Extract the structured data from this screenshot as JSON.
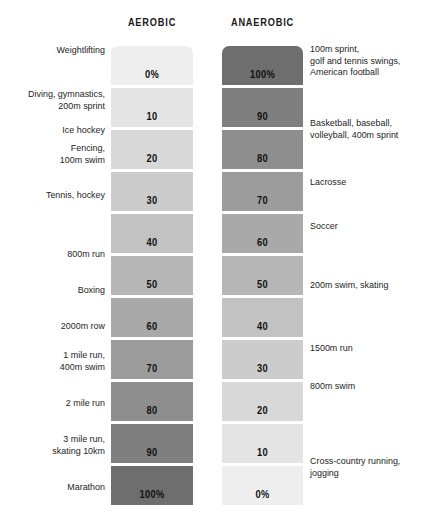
{
  "headers": {
    "left": "AEROBIC",
    "right": "ANAEROBIC"
  },
  "chart_data": {
    "type": "bar",
    "title": "",
    "subtitle": "",
    "xlabel": "",
    "ylabel": "",
    "grid": false,
    "legend_position": "top",
    "orientation": "horizontal-paired-columns",
    "categories": [
      "row-1",
      "row-2",
      "row-3",
      "row-4",
      "row-5",
      "row-6",
      "row-7",
      "row-8",
      "row-9",
      "row-10",
      "row-11"
    ],
    "series": [
      {
        "name": "AEROBIC",
        "values": [
          0,
          10,
          20,
          30,
          40,
          50,
          60,
          70,
          80,
          90,
          100
        ],
        "value_labels": [
          "0%",
          "10",
          "20",
          "30",
          "40",
          "50",
          "60",
          "70",
          "80",
          "90",
          "100%"
        ],
        "colors": [
          "#eeeeee",
          "#e4e4e4",
          "#d8d8d8",
          "#cccccc",
          "#c2c2c2",
          "#b6b6b6",
          "#a9a9a9",
          "#9c9c9c",
          "#8e8e8e",
          "#7f7f7f",
          "#6e6e6e"
        ]
      },
      {
        "name": "ANAEROBIC",
        "values": [
          100,
          90,
          80,
          70,
          60,
          50,
          40,
          30,
          20,
          10,
          0
        ],
        "value_labels": [
          "100%",
          "90",
          "80",
          "70",
          "60",
          "50",
          "40",
          "30",
          "20",
          "10",
          "0%"
        ],
        "colors": [
          "#6e6e6e",
          "#7f7f7f",
          "#8e8e8e",
          "#9c9c9c",
          "#a9a9a9",
          "#b6b6b6",
          "#c2c2c2",
          "#cccccc",
          "#d8d8d8",
          "#e4e4e4",
          "#eeeeee"
        ]
      }
    ],
    "annotations_left": [
      "Weightlifting",
      "Diving, gymnastics,\n200m sprint",
      "Ice hockey",
      "Fencing,\n100m swim",
      "Tennis, hockey",
      "800m run",
      "Boxing",
      "2000m row",
      "1 mile run,\n400m swim",
      "2 mile run",
      "3 mile run,\nskating 10km",
      "Marathon"
    ],
    "annotations_right": [
      "100m sprint,\ngolf and tennis swings,\nAmerican football",
      "Basketball, baseball,\nvolleyball, 400m sprint",
      "Lacrosse",
      "Soccer",
      "200m swim, skating",
      "1500m run",
      "800m swim",
      "Cross-country running,\njogging"
    ]
  },
  "labels_left": [
    {
      "text": "Weightlifting",
      "top": 44
    },
    {
      "text": "Diving, gymnastics,\n200m sprint",
      "top": 88
    },
    {
      "text": "Ice hockey",
      "top": 124
    },
    {
      "text": "Fencing,\n100m swim",
      "top": 142
    },
    {
      "text": "Tennis, hockey",
      "top": 189
    },
    {
      "text": "800m run",
      "top": 248
    },
    {
      "text": "Boxing",
      "top": 284
    },
    {
      "text": "2000m row",
      "top": 320
    },
    {
      "text": "1 mile run,\n400m swim",
      "top": 349
    },
    {
      "text": "2 mile run",
      "top": 397
    },
    {
      "text": "3 mile run,\nskating 10km",
      "top": 433
    },
    {
      "text": "Marathon",
      "top": 481
    }
  ],
  "labels_right": [
    {
      "text": "100m sprint,\ngolf and tennis swings,\nAmerican football",
      "top": 43
    },
    {
      "text": "Basketball, baseball,\nvolleyball, 400m sprint",
      "top": 117
    },
    {
      "text": "Lacrosse",
      "top": 176
    },
    {
      "text": "Soccer",
      "top": 220
    },
    {
      "text": "200m swim, skating",
      "top": 279
    },
    {
      "text": "1500m run",
      "top": 342
    },
    {
      "text": "800m swim",
      "top": 380
    },
    {
      "text": "Cross-country running,\njogging",
      "top": 455
    }
  ],
  "geometry": {
    "bar_top_start": 46,
    "bar_height": 39,
    "bar_gap": 3
  }
}
